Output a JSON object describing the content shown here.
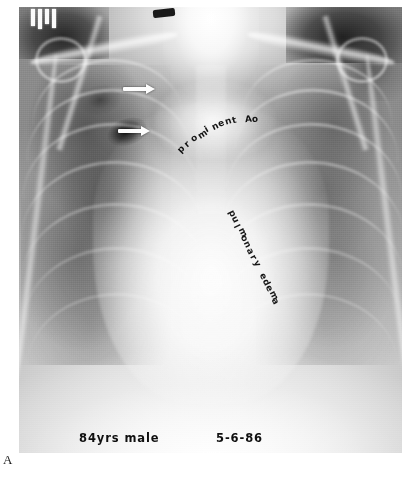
{
  "figure": {
    "panel_label": "A",
    "modality": "chest-radiograph",
    "view": "frontal-AP"
  },
  "radiograph": {
    "patient_info": "84yrs male",
    "study_date": "5-6-86"
  },
  "annotations": [
    {
      "id": "prominent-ao",
      "text": "prominent Ao",
      "style": "curved-arc",
      "target": "aortic-knob"
    },
    {
      "id": "pulmonary-edema",
      "text": "pulmonary edema",
      "style": "diagonal-rotated",
      "target": "perihilar-opacity"
    }
  ],
  "arrows": [
    {
      "id": "arrow-upper",
      "label": "upper-arrow-marker",
      "points_to": "right-upper-zone-lesion"
    },
    {
      "id": "arrow-lower",
      "label": "lower-arrow-marker",
      "points_to": "right-mid-zone-cavity"
    }
  ],
  "colors": {
    "page_background": "#ffffff",
    "film_light": "#fdfdfd",
    "film_mid": "#b4b4b4",
    "film_dark": "#2a2a2a",
    "annotation_text": "#141414",
    "arrow_fill": "#fdfdfd"
  }
}
